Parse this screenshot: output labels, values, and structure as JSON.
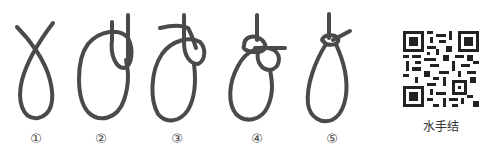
{
  "figure": {
    "steps": [
      {
        "number": "①",
        "icon": "rope-crossed-loop-icon"
      },
      {
        "number": "②",
        "icon": "rope-loop-with-bight-icon"
      },
      {
        "number": "③",
        "icon": "rope-tail-wrap-icon"
      },
      {
        "number": "④",
        "icon": "rope-tail-through-icon"
      },
      {
        "number": "⑤",
        "icon": "bowline-finished-icon"
      }
    ],
    "rope_color": "#4a4a4a"
  },
  "qr": {
    "icon": "qr-code-icon",
    "label": "水手结"
  }
}
